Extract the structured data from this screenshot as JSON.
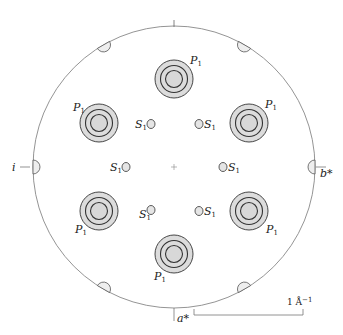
{
  "diagram": {
    "type": "reciprocal-space diffraction pattern",
    "colors": {
      "line": "#555555",
      "ring": "#333333",
      "fill": "#dcdcdc",
      "background": "#ffffff"
    },
    "boundary_circle": {
      "cx": 174,
      "cy": 167,
      "r": 141
    },
    "center_mark": {
      "cx": 174,
      "cy": 167,
      "symbol": "+"
    },
    "axes": {
      "a_star": {
        "label": "a*",
        "position": "bottom"
      },
      "b_star": {
        "label": "b*",
        "position": "right"
      },
      "i": {
        "label": "i",
        "position": "left"
      }
    },
    "primary_spots": {
      "label": "P",
      "subscript": "1",
      "items": [
        {
          "cx": 174,
          "cy": 79,
          "label_pos": "upper-right"
        },
        {
          "cx": 99,
          "cy": 123,
          "label_pos": "upper-left"
        },
        {
          "cx": 249,
          "cy": 123,
          "label_pos": "upper-right"
        },
        {
          "cx": 99,
          "cy": 211,
          "label_pos": "lower-left"
        },
        {
          "cx": 249,
          "cy": 211,
          "label_pos": "lower-right"
        },
        {
          "cx": 174,
          "cy": 254,
          "label_pos": "lower-left"
        }
      ]
    },
    "secondary_spots": {
      "label": "S",
      "subscript": "1",
      "items": [
        {
          "cx": 151,
          "cy": 124,
          "label_pos": "left"
        },
        {
          "cx": 199,
          "cy": 124,
          "label_pos": "right"
        },
        {
          "cx": 126,
          "cy": 167,
          "label_pos": "left"
        },
        {
          "cx": 223,
          "cy": 167,
          "label_pos": "right"
        },
        {
          "cx": 151,
          "cy": 210,
          "label_pos": "lower-left"
        },
        {
          "cx": 199,
          "cy": 211,
          "label_pos": "right"
        }
      ]
    },
    "edge_markers": {
      "count": 6,
      "angles_deg": [
        0,
        60,
        120,
        180,
        240,
        300
      ]
    },
    "scale_bar": {
      "label_number": "1",
      "label_unit": "Å",
      "label_exp": "−1",
      "x1": 194,
      "x2": 303,
      "y": 315
    }
  }
}
